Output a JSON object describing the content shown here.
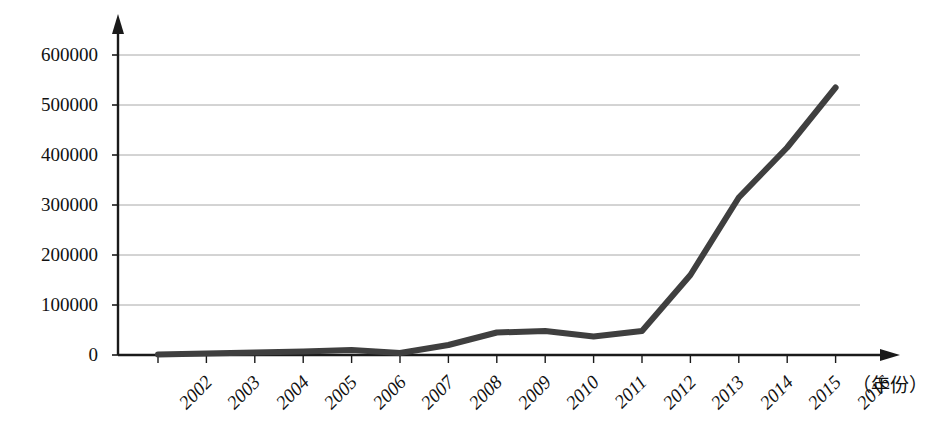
{
  "chart_data": {
    "type": "line",
    "title": "",
    "xlabel": "（年份）",
    "ylabel": "",
    "categories": [
      "2002",
      "2003",
      "2004",
      "2005",
      "2006",
      "2007",
      "2008",
      "2009",
      "2010",
      "2011",
      "2012",
      "2013",
      "2014",
      "2015",
      "2016"
    ],
    "values": [
      1000,
      3000,
      5000,
      7000,
      10000,
      4000,
      20000,
      45000,
      48000,
      37000,
      48000,
      160000,
      315000,
      415000,
      535000
    ],
    "series": [
      {
        "name": "",
        "values": [
          1000,
          3000,
          5000,
          7000,
          10000,
          4000,
          20000,
          45000,
          48000,
          37000,
          48000,
          160000,
          315000,
          415000,
          535000
        ]
      }
    ],
    "ylim": [
      0,
      600000
    ],
    "yticks": [
      0,
      100000,
      200000,
      300000,
      400000,
      500000,
      600000
    ],
    "ytick_labels": [
      "0",
      "100000",
      "200000",
      "300000",
      "400000",
      "500000",
      "600000"
    ],
    "xtick_labels": [
      "2002",
      "2003",
      "2004",
      "2005",
      "2006",
      "2007",
      "2008",
      "2009",
      "2010",
      "2011",
      "2012",
      "2013",
      "2014",
      "2015",
      "2016"
    ],
    "grid": "horizontal",
    "legend": "none",
    "line_color": "#3f3f3f",
    "axis_color": "#1a1a1a",
    "grid_color": "#a8a8a8",
    "line_width": 6,
    "axis_arrows": "both"
  },
  "axes": {
    "x_axis_name": "year-axis",
    "y_axis_name": "value-axis",
    "x_unit_label": "（年份）"
  }
}
